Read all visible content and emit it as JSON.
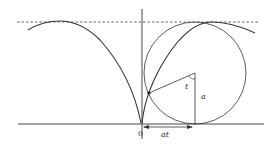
{
  "figure": {
    "type": "cycloid-construction",
    "labels": {
      "origin": "0",
      "arc_length": "at",
      "angle": "t",
      "radius": "a"
    },
    "colors": {
      "stroke": "#333333",
      "background": "#ffffff"
    }
  }
}
